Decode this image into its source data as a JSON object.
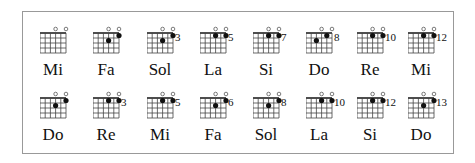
{
  "chart_title": "",
  "rows": [
    {
      "chords": [
        {
          "name": "Mi",
          "fret": "",
          "open": [
            3,
            5
          ],
          "dots": []
        },
        {
          "name": "Fa",
          "fret": "",
          "open": [
            3,
            5
          ],
          "dots": [
            [
              3,
              2
            ],
            [
              5,
              1
            ]
          ]
        },
        {
          "name": "Sol",
          "fret": "3",
          "open": [
            3,
            5
          ],
          "dots": [
            [
              3,
              2
            ],
            [
              5,
              1
            ]
          ]
        },
        {
          "name": "La",
          "fret": "5",
          "open": [
            3,
            5
          ],
          "dots": [
            [
              3,
              1
            ],
            [
              5,
              1
            ]
          ]
        },
        {
          "name": "Si",
          "fret": "7",
          "open": [
            3,
            5
          ],
          "dots": [
            [
              3,
              1
            ],
            [
              5,
              1
            ]
          ]
        },
        {
          "name": "Do",
          "fret": "8",
          "open": [
            3,
            5
          ],
          "dots": [
            [
              2,
              2
            ],
            [
              4,
              1
            ]
          ]
        },
        {
          "name": "Re",
          "fret": "10",
          "open": [
            3,
            5
          ],
          "dots": [
            [
              3,
              1
            ],
            [
              5,
              1
            ]
          ]
        },
        {
          "name": "Mi",
          "fret": "12",
          "open": [
            3,
            5
          ],
          "dots": [
            [
              3,
              1
            ],
            [
              5,
              1
            ]
          ]
        }
      ]
    },
    {
      "chords": [
        {
          "name": "Do",
          "fret": "",
          "open": [
            3,
            5
          ],
          "dots": [
            [
              3,
              2
            ],
            [
              5,
              1
            ]
          ]
        },
        {
          "name": "Re",
          "fret": "3",
          "open": [
            3,
            5
          ],
          "dots": [
            [
              3,
              1
            ],
            [
              5,
              1
            ]
          ]
        },
        {
          "name": "Mi",
          "fret": "5",
          "open": [
            3,
            5
          ],
          "dots": [
            [
              3,
              1
            ],
            [
              5,
              1
            ]
          ]
        },
        {
          "name": "Fa",
          "fret": "6",
          "open": [
            3,
            5
          ],
          "dots": [
            [
              3,
              2
            ],
            [
              5,
              1
            ]
          ]
        },
        {
          "name": "Sol",
          "fret": "8",
          "open": [
            3,
            5
          ],
          "dots": [
            [
              3,
              2
            ],
            [
              5,
              1
            ]
          ]
        },
        {
          "name": "La",
          "fret": "10",
          "open": [
            3,
            5
          ],
          "dots": [
            [
              3,
              1
            ],
            [
              5,
              1
            ]
          ]
        },
        {
          "name": "Si",
          "fret": "12",
          "open": [
            3,
            5
          ],
          "dots": [
            [
              3,
              1
            ],
            [
              5,
              1
            ]
          ]
        },
        {
          "name": "Do",
          "fret": "13",
          "open": [
            3,
            5
          ],
          "dots": [
            [
              3,
              2
            ],
            [
              5,
              1
            ]
          ]
        }
      ]
    }
  ]
}
